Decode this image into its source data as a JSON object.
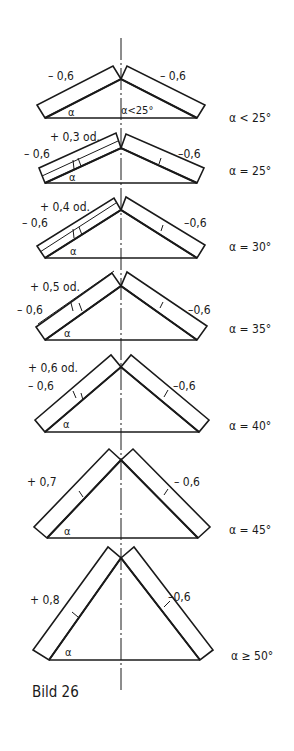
{
  "figure": {
    "caption": "Bild 26",
    "line_color": "#1a1a1a",
    "background": "#ffffff",
    "axis_x": 121
  },
  "diagrams": [
    {
      "id": "alpha-lt-25",
      "angle_label": "α < 25°",
      "inner_angle_label": "α<25°",
      "alpha_symbol": "α",
      "left_coef": "– 0,6",
      "left_coef_line2": "",
      "right_coef": "– 0,6",
      "apex": [
        121,
        79
      ],
      "base_y": 118,
      "base_left": 45,
      "base_right": 197
    },
    {
      "id": "alpha-25",
      "angle_label": "α = 25°",
      "alpha_symbol": "α",
      "left_coef": "+ 0,3 od.",
      "left_coef_line2": "– 0,6",
      "right_coef": "–0,6",
      "apex": [
        121,
        148
      ],
      "base_y": 183,
      "base_left": 45,
      "base_right": 197
    },
    {
      "id": "alpha-30",
      "angle_label": "α = 30°",
      "alpha_symbol": "α",
      "left_coef": "+ 0,4 od.",
      "left_coef_line2": "– 0,6",
      "right_coef": "–0,6",
      "apex": [
        121,
        210
      ],
      "base_y": 258,
      "base_left": 45,
      "base_right": 197
    },
    {
      "id": "alpha-35",
      "angle_label": "α = 35°",
      "alpha_symbol": "α",
      "left_coef": "+ 0,5 od.",
      "left_coef_line2": "– 0,6",
      "right_coef": "–0,6",
      "apex": [
        121,
        286
      ],
      "base_y": 340,
      "base_left": 45,
      "base_right": 197
    },
    {
      "id": "alpha-40",
      "angle_label": "α = 40°",
      "alpha_symbol": "α",
      "left_coef": "+ 0,6 od.",
      "left_coef_line2": "– 0,6",
      "right_coef": "–0,6",
      "apex": [
        121,
        367
      ],
      "base_y": 432,
      "base_left": 45,
      "base_right": 199
    },
    {
      "id": "alpha-45",
      "angle_label": "α = 45°",
      "alpha_symbol": "α",
      "left_coef": "+ 0,7",
      "left_coef_line2": "",
      "right_coef": "– 0,6",
      "apex": [
        121,
        460
      ],
      "base_y": 538,
      "base_left": 47,
      "base_right": 198
    },
    {
      "id": "alpha-ge-50",
      "angle_label": "α ≥ 50°",
      "alpha_symbol": "α",
      "left_coef": "+ 0,8",
      "left_coef_line2": "",
      "right_coef": "–0,6",
      "apex": [
        121,
        558
      ],
      "base_y": 660,
      "base_left": 49,
      "base_right": 200
    }
  ]
}
